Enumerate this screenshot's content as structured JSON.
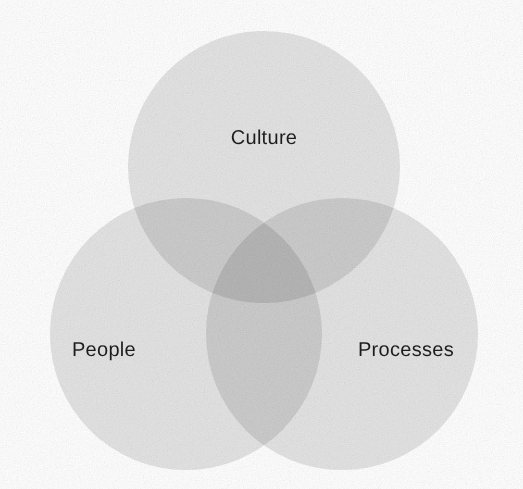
{
  "diagram": {
    "type": "venn",
    "set_count": 3,
    "title": "",
    "canvas": {
      "width": 523,
      "height": 489,
      "background": "#ffffff"
    },
    "style": {
      "circle_fill": "#e4e4e4",
      "circle_opacity": 1,
      "blend_mode": "multiply",
      "pairwise_overlap_color": "#c9c9c9",
      "triple_overlap_color": "#b0b0b0",
      "label_color": "#1d1d1d",
      "label_font_size_px": 20,
      "has_outline": false,
      "texture": "paper-grain"
    },
    "sets": [
      {
        "id": "culture",
        "label": "Culture",
        "position": "top",
        "center": {
          "x": 264,
          "y": 167
        },
        "radius": 136,
        "label_position": {
          "x": 264,
          "y": 138
        },
        "fill": "#e4e4e4"
      },
      {
        "id": "people",
        "label": "People",
        "position": "bottom-left",
        "center": {
          "x": 186,
          "y": 334
        },
        "radius": 136,
        "label_position": {
          "x": 104,
          "y": 350
        },
        "fill": "#e4e4e4"
      },
      {
        "id": "processes",
        "label": "Processes",
        "position": "bottom-right",
        "center": {
          "x": 342,
          "y": 334
        },
        "radius": 136,
        "label_position": {
          "x": 406,
          "y": 350
        },
        "fill": "#e4e4e4"
      }
    ],
    "intersections": [
      {
        "id": "culture-people",
        "sets": [
          "culture",
          "people"
        ],
        "label": "",
        "shade": "#c9c9c9"
      },
      {
        "id": "culture-processes",
        "sets": [
          "culture",
          "processes"
        ],
        "label": "",
        "shade": "#c9c9c9"
      },
      {
        "id": "people-processes",
        "sets": [
          "people",
          "processes"
        ],
        "label": "",
        "shade": "#c9c9c9"
      },
      {
        "id": "culture-people-processes",
        "sets": [
          "culture",
          "people",
          "processes"
        ],
        "label": "",
        "shade": "#b0b0b0"
      }
    ]
  }
}
